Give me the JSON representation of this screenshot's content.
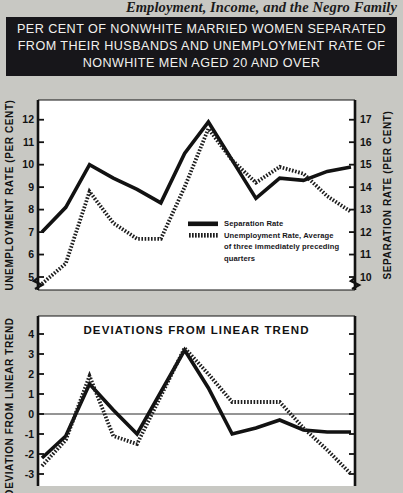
{
  "running_head": "Employment, Income, and the Negro Family",
  "title": {
    "line1": "PER CENT OF NONWHITE MARRIED WOMEN SEPARATED",
    "line2": "FROM THEIR HUSBANDS AND UNEMPLOYMENT RATE OF",
    "line3": "NONWHITE MEN AGED 20 AND OVER"
  },
  "colors": {
    "page_background": "#c8c8c3",
    "title_band": "#17161a",
    "plot_background": "#ffffff",
    "separation_series": "#121212",
    "unemployment_series": "#6f6f6f",
    "axis": "#121212"
  },
  "legend": {
    "items": [
      {
        "label": "Separation Rate",
        "style": "solid"
      },
      {
        "label": "Unemployment Rate, Average",
        "style": "hatched"
      },
      {
        "label": "of three immediately preceding",
        "style": "continuation"
      },
      {
        "label": "quarters",
        "style": "continuation"
      }
    ]
  },
  "chart_data": [
    {
      "id": "upper-panel",
      "type": "line",
      "title": "",
      "xlabel": "",
      "ylabel": "UNEMPLOYMENT RATE (PER CENT)",
      "y2label": "SEPARATION RATE (PER CENT)",
      "grid": false,
      "axis_break": true,
      "ylim": [
        4.6,
        12.7
      ],
      "yticks": [
        5,
        6,
        7,
        8,
        9,
        10,
        11,
        12
      ],
      "ytick_labels": [
        "5",
        "6",
        "7",
        "8",
        "9",
        "10",
        "11",
        "12"
      ],
      "y2lim": [
        9.6,
        17.7
      ],
      "y2ticks": [
        10,
        11,
        12,
        13,
        14,
        15,
        16,
        17
      ],
      "y2tick_labels": [
        "10",
        "11",
        "12",
        "13",
        "14",
        "15",
        "16",
        "17"
      ],
      "x": [
        0,
        1,
        2,
        3,
        4,
        5,
        6,
        7,
        8,
        9,
        10,
        11,
        12,
        13
      ],
      "series": [
        {
          "name": "Separation Rate",
          "axis": "right",
          "style": "solid",
          "values": [
            12.0,
            13.1,
            15.0,
            14.4,
            13.9,
            13.3,
            15.5,
            16.9,
            15.2,
            13.5,
            14.4,
            14.3,
            14.7,
            14.9
          ]
        },
        {
          "name": "Unemployment Rate, Average of three immediately preceding quarters",
          "axis": "left",
          "style": "hatched",
          "values": [
            4.7,
            5.6,
            8.8,
            7.4,
            6.7,
            6.7,
            9.0,
            11.6,
            10.2,
            9.2,
            9.9,
            9.6,
            8.6,
            7.9
          ]
        }
      ]
    },
    {
      "id": "lower-panel",
      "type": "line",
      "title": "DEVIATIONS FROM LINEAR TREND",
      "xlabel": "",
      "ylabel": "DEVIATION FROM LINEAR TREND",
      "grid": false,
      "zero_line": true,
      "ylim": [
        -3.4,
        4.6
      ],
      "yticks": [
        -3,
        -2,
        -1,
        0,
        1,
        2,
        3,
        4
      ],
      "ytick_labels": [
        "-3",
        "-2",
        "-1",
        "0",
        "1",
        "2",
        "3",
        "4"
      ],
      "x": [
        0,
        1,
        2,
        3,
        4,
        5,
        6,
        7,
        8,
        9,
        10,
        11,
        12,
        13
      ],
      "series": [
        {
          "name": "Separation Rate",
          "style": "solid",
          "values": [
            -2.2,
            -1.1,
            1.5,
            0.2,
            -1.0,
            1.1,
            3.2,
            1.3,
            -1.0,
            -0.7,
            -0.3,
            -0.8,
            -0.9,
            -0.9
          ]
        },
        {
          "name": "Unemployment Rate, Average of three immediately preceding quarters",
          "style": "hatched",
          "values": [
            -2.6,
            -1.3,
            1.9,
            -1.1,
            -1.5,
            0.9,
            3.3,
            2.0,
            0.6,
            0.6,
            0.6,
            -0.7,
            -1.8,
            -3.0
          ]
        }
      ]
    }
  ]
}
